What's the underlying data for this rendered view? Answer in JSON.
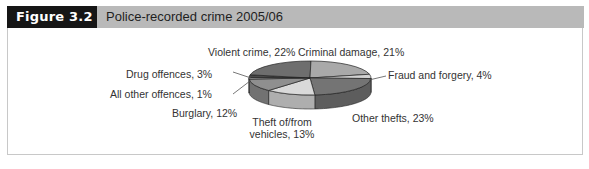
{
  "figure": {
    "label": "Figure 3.2",
    "title": "Police-recorded crime 2005/06"
  },
  "chart_data": {
    "type": "pie",
    "style": "3d",
    "title": "Police-recorded crime 2005/06",
    "slices": [
      {
        "name": "Drug offences",
        "value": 3,
        "label": "Drug offences, 3%",
        "color": "#4a4a4a"
      },
      {
        "name": "Violent crime",
        "value": 22,
        "label": "Violent crime, 22%",
        "color": "#6e6e6e"
      },
      {
        "name": "Criminal damage",
        "value": 21,
        "label": "Criminal damage, 21%",
        "color": "#a9a9a9"
      },
      {
        "name": "Fraud and forgery",
        "value": 4,
        "label": "Fraud and forgery, 4%",
        "color": "#d2d2d2"
      },
      {
        "name": "Other thefts",
        "value": 23,
        "label": "Other thefts, 23%",
        "color": "#747474"
      },
      {
        "name": "Theft of/from vehicles",
        "value": 13,
        "label": "Theft of/from vehicles, 13%",
        "color": "#d9d9d9"
      },
      {
        "name": "Burglary",
        "value": 12,
        "label": "Burglary, 12%",
        "color": "#8f8f8f"
      },
      {
        "name": "All other offences",
        "value": 1,
        "label": "All other offences, 1%",
        "color": "#f4f4f4"
      }
    ],
    "legend": "inline labels with leader lines"
  },
  "labels": {
    "violent": "Violent crime, 22%",
    "criminal": "Criminal damage, 21%",
    "fraud": "Fraud and forgery, 4%",
    "other_thefts": "Other thefts, 23%",
    "vehicles_line1": "Theft of/from",
    "vehicles_line2": "vehicles, 13%",
    "burglary": "Burglary, 12%",
    "all_other": "All other offences, 1%",
    "drug": "Drug offences, 3%"
  }
}
